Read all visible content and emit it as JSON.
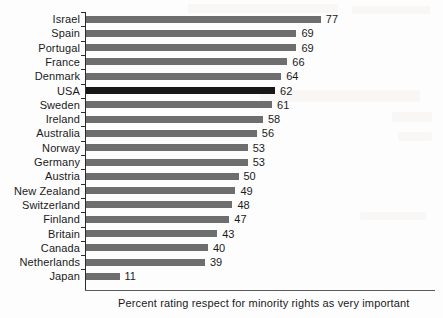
{
  "chart_data": {
    "type": "bar",
    "orientation": "horizontal",
    "title": "",
    "subtitle": "",
    "xlabel": "Percent rating respect for minority rights as very important",
    "ylabel": "",
    "categories": [
      "Israel",
      "Spain",
      "Portugal",
      "France",
      "Denmark",
      "USA",
      "Sweden",
      "Ireland",
      "Australia",
      "Norway",
      "Germany",
      "Austria",
      "New Zealand",
      "Switzerland",
      "Finland",
      "Britain",
      "Canada",
      "Netherlands",
      "Japan"
    ],
    "values": [
      77,
      69,
      69,
      66,
      64,
      62,
      61,
      58,
      56,
      53,
      53,
      50,
      49,
      48,
      47,
      43,
      40,
      39,
      11
    ],
    "value_labels": [
      "77",
      "69",
      "69",
      "66",
      "64",
      "62",
      "61",
      "58",
      "56",
      "53",
      "53",
      "50",
      "49",
      "48",
      "47",
      "43",
      "40",
      "39",
      "11"
    ],
    "highlighted_category": "USA",
    "xlim": [
      0,
      77
    ],
    "grid": false,
    "legend": null,
    "axis_tick_labels": [],
    "colors": {
      "bar": "#6e6e6e",
      "bar_highlight": "#171717",
      "axis": "#2b2b2b",
      "text": "#1a1a1a",
      "background": "#fdfdfd"
    }
  },
  "caption": {
    "text": "Percent rating respect for minority rights as very important"
  }
}
